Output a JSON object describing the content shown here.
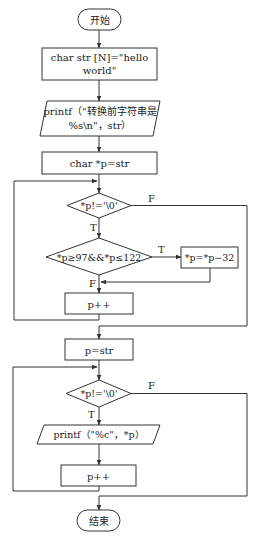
{
  "diagram": {
    "type": "flowchart",
    "nodes": {
      "start": {
        "shape": "terminal",
        "label": "开始"
      },
      "init_str": {
        "shape": "process",
        "line1": "char str [N]=\"hello",
        "line2": "world\""
      },
      "print_before": {
        "shape": "io",
        "line1": "printf（\"转换前字符串是",
        "line2": "%s\\n\"，str）"
      },
      "init_p": {
        "shape": "process",
        "label": "char *p=str"
      },
      "cond1": {
        "shape": "decision",
        "label": "*p!='\\0'"
      },
      "cond_lower": {
        "shape": "decision",
        "label": "*p≥97&&*p≤122"
      },
      "to_upper": {
        "shape": "process",
        "label": "*p=*p−32"
      },
      "inc1": {
        "shape": "process",
        "label": "p++"
      },
      "reset_p": {
        "shape": "process",
        "label": "p=str"
      },
      "cond2": {
        "shape": "decision",
        "label": "*p!='\\0'"
      },
      "print_char": {
        "shape": "io",
        "label": "printf（\"%c\"，*p）"
      },
      "inc2": {
        "shape": "process",
        "label": "p++"
      },
      "end": {
        "shape": "terminal",
        "label": "结束"
      }
    },
    "edge_labels": {
      "cond1_true": "T",
      "cond1_false": "F",
      "cond_lower_true": "T",
      "cond_lower_false": "F",
      "cond2_true": "T",
      "cond2_false": "F"
    },
    "edges": [
      {
        "from": "start",
        "to": "init_str"
      },
      {
        "from": "init_str",
        "to": "print_before"
      },
      {
        "from": "print_before",
        "to": "init_p"
      },
      {
        "from": "init_p",
        "to": "cond1"
      },
      {
        "from": "cond1",
        "to": "cond_lower",
        "label": "T"
      },
      {
        "from": "cond1",
        "to": "reset_p",
        "label": "F"
      },
      {
        "from": "cond_lower",
        "to": "to_upper",
        "label": "T"
      },
      {
        "from": "cond_lower",
        "to": "inc1",
        "label": "F"
      },
      {
        "from": "to_upper",
        "to": "inc1"
      },
      {
        "from": "inc1",
        "to": "cond1"
      },
      {
        "from": "reset_p",
        "to": "cond2"
      },
      {
        "from": "cond2",
        "to": "print_char",
        "label": "T"
      },
      {
        "from": "cond2",
        "to": "end",
        "label": "F"
      },
      {
        "from": "print_char",
        "to": "inc2"
      },
      {
        "from": "inc2",
        "to": "cond2"
      }
    ]
  }
}
